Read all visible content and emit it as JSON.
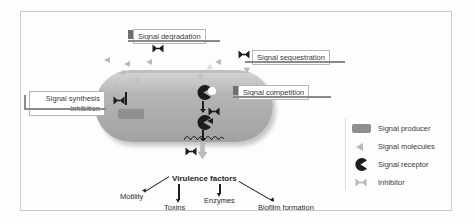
{
  "figure": {
    "callouts": [
      {
        "id": "signal-degradation",
        "text": "Signal degradation"
      },
      {
        "id": "signal-sequestration",
        "text": "Signal sequestration"
      },
      {
        "id": "signal-synthesis-inhibition",
        "line1": "Signal synthesis",
        "line2": "inhibition"
      },
      {
        "id": "signal-competition",
        "text": "Signal competition"
      }
    ],
    "legend": {
      "items": [
        {
          "icon": "signal-producer-icon",
          "label": "Signal producer"
        },
        {
          "icon": "signal-molecule-icon",
          "label": "Signal molecules"
        },
        {
          "icon": "signal-receptor-icon",
          "label": "Signal receptor"
        },
        {
          "icon": "inhibitor-icon",
          "label": "Inhibitor"
        }
      ]
    },
    "output": {
      "title": "Virulence factors",
      "leaves": [
        "Motility",
        "Toxins",
        "Enzymes",
        "Biofilm formation"
      ]
    },
    "colors": {
      "cell_fill": "#b2b2b2",
      "producer_fill": "#8f8f8f",
      "molecule_fill": "#b9b9b9",
      "receptor_fill": "#1d1d1d",
      "frame_border": "#c9c9c9",
      "arrow": "#1d1d1d"
    }
  }
}
